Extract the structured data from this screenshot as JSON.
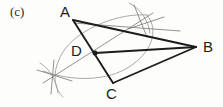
{
  "figure": {
    "panel_label": "(c)",
    "caption_text": "",
    "background_color": "#fdfdfc",
    "ink_color": "#1c1c1c",
    "construction_color": "#8a8a8a",
    "arc_color": "#9a9a9a"
  },
  "labels": {
    "panel": "(c)",
    "a": "A",
    "b": "B",
    "c": "C",
    "d": "D"
  },
  "chart_data": {
    "type": "diagram",
    "title": "(c)",
    "points": [
      {
        "name": "A",
        "x": 73,
        "y": 20,
        "label_x": 60,
        "label_y": 4
      },
      {
        "name": "B",
        "x": 196,
        "y": 47,
        "label_x": 203,
        "label_y": 39
      },
      {
        "name": "C",
        "x": 113,
        "y": 83,
        "label_x": 106,
        "label_y": 86
      },
      {
        "name": "D",
        "x": 95,
        "y": 53,
        "label_x": 71,
        "label_y": 43,
        "marked": true
      },
      {
        "name": "X1",
        "x": 140,
        "y": 22,
        "label": "",
        "marked": false
      },
      {
        "name": "X2",
        "x": 52,
        "y": 76,
        "label": "",
        "marked": false
      }
    ],
    "heavy_segments": [
      {
        "from": "A",
        "to": "B",
        "x1": 73,
        "y1": 20,
        "x2": 196,
        "y2": 47
      },
      {
        "from": "A",
        "to": "C",
        "x1": 73,
        "y1": 20,
        "x2": 113,
        "y2": 83
      },
      {
        "from": "D",
        "to": "B",
        "x1": 95,
        "y1": 53,
        "x2": 196,
        "y2": 47
      },
      {
        "from": "C",
        "to": "B",
        "x1": 113,
        "y1": 83,
        "x2": 196,
        "y2": 47
      }
    ],
    "construction_lines": [
      {
        "name": "bisector-through-D",
        "x1": 44,
        "y1": 82,
        "x2": 152,
        "y2": 14
      },
      {
        "name": "ray-from-A-to-X1-right",
        "x1": 73,
        "y1": 22,
        "x2": 178,
        "y2": 30
      },
      {
        "name": "ray-x1-upper",
        "x1": 134,
        "y1": 6,
        "x2": 146,
        "y2": 36
      },
      {
        "name": "ray-x1-lower-right",
        "x1": 129,
        "y1": 28,
        "x2": 162,
        "y2": 18
      },
      {
        "name": "ray-x2-vertical",
        "x1": 53,
        "y1": 61,
        "x2": 52,
        "y2": 93
      },
      {
        "name": "ray-x2-horizontal",
        "x1": 38,
        "y1": 70,
        "x2": 70,
        "y2": 80
      }
    ],
    "arcs": [
      {
        "name": "large-arc-left",
        "path": "M 147 15 C 120 13, 80 26, 64 48 C 50 68, 52 88, 62 96",
        "stroke": "#9a9a9a"
      },
      {
        "name": "large-arc-right",
        "path": "M 147 15 C 160 30, 152 52, 130 66 C 108 80, 74 82, 44 72",
        "stroke": "#9a9a9a"
      },
      {
        "name": "small-arc-upper",
        "path": "M 128 4 C 140 10, 147 20, 149 32",
        "stroke": "#9a9a9a"
      },
      {
        "name": "small-arc-lower",
        "path": "M 40 64 C 50 70, 56 80, 58 92",
        "stroke": "#9a9a9a"
      }
    ],
    "xlabel": "",
    "ylabel": "",
    "grid": false,
    "legend": "none"
  }
}
